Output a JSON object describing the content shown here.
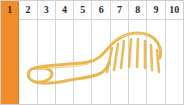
{
  "grid": {
    "column_count": 10,
    "selected_column": "1",
    "columns": [
      {
        "label": "1",
        "selected": true
      },
      {
        "label": "2",
        "selected": false
      },
      {
        "label": "3",
        "selected": false
      },
      {
        "label": "4",
        "selected": false
      },
      {
        "label": "5",
        "selected": false
      },
      {
        "label": "6",
        "selected": false
      },
      {
        "label": "7",
        "selected": false
      },
      {
        "label": "8",
        "selected": false
      },
      {
        "label": "9",
        "selected": false
      },
      {
        "label": "10",
        "selected": false
      }
    ]
  },
  "colors": {
    "selected_column": "#f08c2a",
    "grid_line": "#d4d4d4",
    "sheet_border": "#c9c9c9",
    "drawing_stroke": "#e8b44a",
    "drawing_stroke_light": "#f0cd83",
    "header_text": "#2b2b2b",
    "background": "#ffffff"
  },
  "drawing": {
    "name": "hairbrush-sketch",
    "description": "hand-drawn hairbrush outline with bristles",
    "spans_columns": [
      "2",
      "3",
      "4",
      "5",
      "6",
      "7",
      "8",
      "9"
    ],
    "bristle_count": 8,
    "stroke_width": 3
  }
}
